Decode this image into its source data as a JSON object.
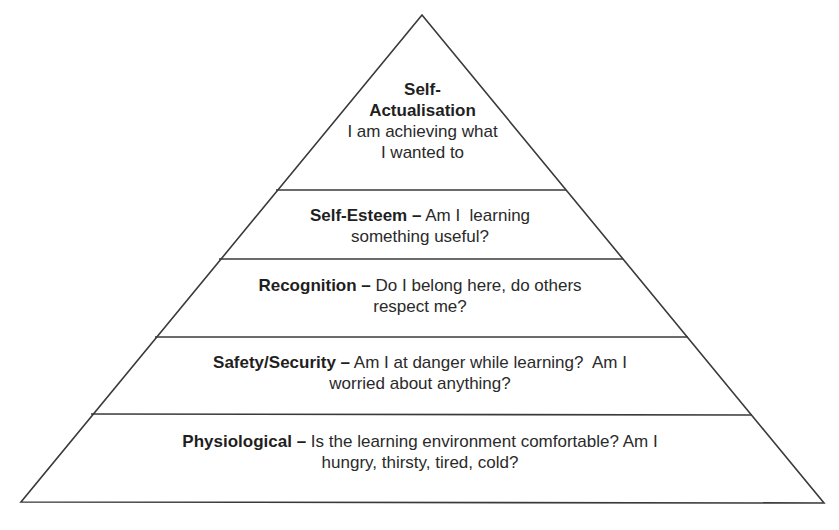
{
  "diagram": {
    "type": "pyramid",
    "levels": [
      {
        "id": "self-actualisation",
        "title_line1": "Self-",
        "title_line2": "Actualisation",
        "desc_line1": "I am achieving what",
        "desc_line2": "I wanted to"
      },
      {
        "id": "self-esteem",
        "title": "Self-Esteem –",
        "desc_line1": " Am I  learning",
        "desc_line2": "something useful?"
      },
      {
        "id": "recognition",
        "title": "Recognition –",
        "desc_line1": " Do I belong here, do others",
        "desc_line2": "respect me?"
      },
      {
        "id": "safety-security",
        "title": "Safety/Security –",
        "desc_line1": " Am I at danger while learning?  Am I",
        "desc_line2": "worried about anything?"
      },
      {
        "id": "physiological",
        "title": "Physiological –",
        "desc_line1": " Is the learning environment comfortable? Am I",
        "desc_line2": "hungry, thirsty, tired, cold?"
      }
    ],
    "colors": {
      "stroke": "#3a3a3a",
      "fill": "#ffffff",
      "text": "#2a2a2a"
    }
  }
}
